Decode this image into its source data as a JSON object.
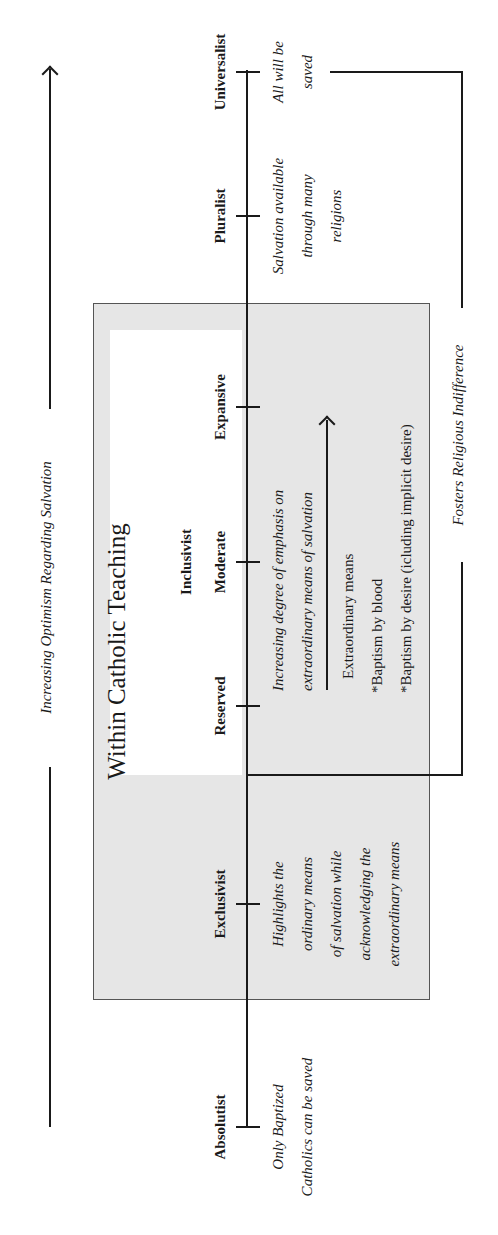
{
  "diagram": {
    "optimism_axis": {
      "label": "Increasing Optimism Regarding Salvation",
      "direction": "toward Universalist"
    },
    "box": {
      "title": "Within Catholic Teaching",
      "background": "#e6e6e6"
    },
    "inclusivist_group": {
      "label": "Inclusivist",
      "background": "#ffffff"
    },
    "positions": [
      {
        "label": "Absolutist",
        "description": "Only Baptized Catholics can be saved"
      },
      {
        "label": "Exclusivist",
        "description": "Highlights the ordinary means of salvation while acknowledging the extraordinary means"
      },
      {
        "label": "Reserved"
      },
      {
        "label": "Moderate"
      },
      {
        "label": "Expansive"
      },
      {
        "label": "Pluralist",
        "description": "Salvation available through many religions"
      },
      {
        "label": "Universalist",
        "description": "All will be saved"
      }
    ],
    "descriptions": {
      "absolutist_l1": "Only Baptized",
      "absolutist_l2": "Catholics can be saved",
      "exclusivist_l1": "Highlights the",
      "exclusivist_l2": "ordinary means",
      "exclusivist_l3": "of salvation while",
      "exclusivist_l4": "acknowledging the",
      "exclusivist_l5": "extraordinary means",
      "pluralist_l1": "Salvation available",
      "pluralist_l2": "through many",
      "pluralist_l3": "religions",
      "universalist_l1": "All will be",
      "universalist_l2": "saved"
    },
    "inclusivist_notes": {
      "emphasis_l1": "Increasing degree of emphasis on",
      "emphasis_l2": "extraordinary means of salvation",
      "means_heading": "Extraordinary means",
      "means_item_1": "*Baptism by blood",
      "means_item_2": "*Baptism by desire (icluding implicit desire)"
    },
    "bracket": {
      "label": "Fosters Religious Indifference",
      "spans": "Inclusivist (Reserved) to Universalist"
    }
  }
}
